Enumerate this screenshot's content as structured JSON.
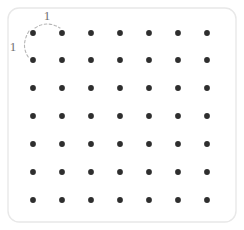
{
  "figure": {
    "background_color": "#ffffff"
  },
  "frame": {
    "name": "rounded-frame",
    "x": 8,
    "y": 8,
    "width": 228,
    "height": 214,
    "corner_radius": 11,
    "stroke_color": "#e8e8e8",
    "fill_color": "#ffffff"
  },
  "lattice": {
    "rows": 7,
    "columns": 7,
    "dot_radius": 2.9,
    "dot_color": "#2e2e2e",
    "x_positions": [
      33,
      62,
      91,
      120,
      149,
      178,
      207
    ],
    "y_positions": [
      33,
      60,
      88,
      116,
      144,
      172,
      200
    ],
    "x_spacing": 29,
    "y_spacing": 27.8
  },
  "annotations": {
    "horizontal_dimension": {
      "name": "horizontal-unit-arc",
      "label": "1",
      "label_x": 47,
      "label_y": 20,
      "arc_path": "M 35 28 Q 47 20 60 28",
      "stroke_color": "#b5b5b5",
      "meaning": "horizontal spacing between adjacent lattice points"
    },
    "vertical_dimension": {
      "name": "vertical-unit-arc",
      "label": "1",
      "label_x": 13,
      "label_y": 51,
      "arc_path": "M 29 31 Q 20 46 29 58",
      "stroke_color": "#b5b5b5",
      "meaning": "vertical spacing between adjacent lattice points"
    },
    "label_color": "#6f6f6f",
    "label_font_size": 13
  },
  "chart_data": {
    "type": "scatter",
    "title": "",
    "xlabel": "",
    "ylabel": "",
    "grid": false,
    "legend": null,
    "xlim": [
      0,
      6
    ],
    "ylim": [
      0,
      6
    ],
    "unit_spacing": 1,
    "point_labels": [
      "1",
      "1"
    ],
    "x": [
      0,
      1,
      2,
      3,
      4,
      5,
      6,
      0,
      1,
      2,
      3,
      4,
      5,
      6,
      0,
      1,
      2,
      3,
      4,
      5,
      6,
      0,
      1,
      2,
      3,
      4,
      5,
      6,
      0,
      1,
      2,
      3,
      4,
      5,
      6,
      0,
      1,
      2,
      3,
      4,
      5,
      6,
      0,
      1,
      2,
      3,
      4,
      5,
      6
    ],
    "y": [
      6,
      6,
      6,
      6,
      6,
      6,
      6,
      5,
      5,
      5,
      5,
      5,
      5,
      5,
      4,
      4,
      4,
      4,
      4,
      4,
      4,
      3,
      3,
      3,
      3,
      3,
      3,
      3,
      2,
      2,
      2,
      2,
      2,
      2,
      2,
      1,
      1,
      1,
      1,
      1,
      1,
      1,
      0,
      0,
      0,
      0,
      0,
      0,
      0
    ],
    "total_points": 49,
    "annotations": [
      {
        "text": "1",
        "kind": "dimension",
        "axis": "x",
        "value": 1
      },
      {
        "text": "1",
        "kind": "dimension",
        "axis": "y",
        "value": 1
      }
    ]
  }
}
